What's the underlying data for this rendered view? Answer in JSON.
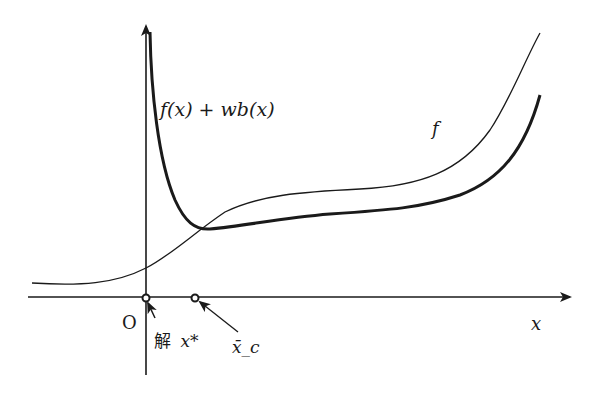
{
  "diagram": {
    "colors": {
      "ink": "#1a1a1a",
      "background": "#ffffff"
    },
    "axes": {
      "origin_label": "O",
      "x_label": "x"
    },
    "curves": [
      {
        "id": "f",
        "label": "f",
        "style": "thin"
      },
      {
        "id": "barrier",
        "label": "f(x) + wb(x)",
        "style": "thick"
      }
    ],
    "points": [
      {
        "id": "solution",
        "label_prefix": "解",
        "label_var": "x*"
      },
      {
        "id": "barrier-min",
        "label": "x̄_c"
      }
    ]
  }
}
